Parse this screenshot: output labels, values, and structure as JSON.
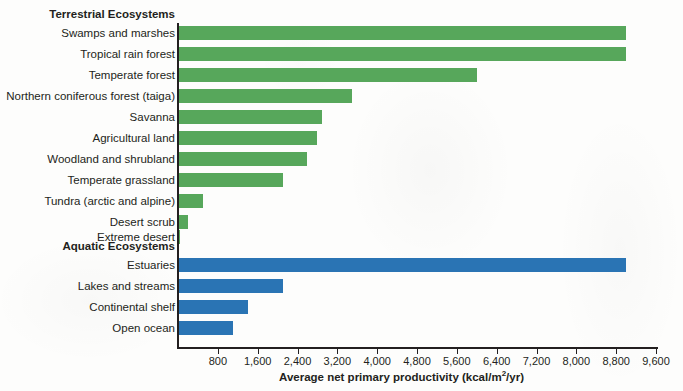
{
  "chart_data": {
    "type": "bar",
    "orientation": "horizontal",
    "title": "",
    "xlabel": "Average net primary productivity (kcal/m2/yr)",
    "xlabel_parts": {
      "before": "Average net primary productivity (kcal/m",
      "sup": "2",
      "after": "/yr)"
    },
    "ylabel": "",
    "xlim": [
      0,
      9600
    ],
    "xticks": [
      800,
      1600,
      2400,
      3200,
      4000,
      4800,
      5600,
      6400,
      7200,
      8000,
      8800,
      9600
    ],
    "xtick_labels": [
      "800",
      "1,600",
      "2,400",
      "3,200",
      "4,000",
      "4,800",
      "5,600",
      "6,400",
      "7,200",
      "8,000",
      "8,800",
      "9,600"
    ],
    "grid": false,
    "legend": "none",
    "colors": {
      "terrestrial": "#57a75b",
      "aquatic": "#2a74b4",
      "axis": "#231f20"
    },
    "groups": [
      {
        "name": "Terrestrial Ecosystems",
        "color_key": "terrestrial",
        "categories": [
          "Swamps and marshes",
          "Tropical rain forest",
          "Temperate forest",
          "Northern coniferous forest (taiga)",
          "Savanna",
          "Agricultural land",
          "Woodland and shrubland",
          "Temperate grassland",
          "Tundra (arctic and alpine)",
          "Desert scrub",
          "Extreme desert"
        ],
        "values": [
          9000,
          9000,
          6000,
          3500,
          2900,
          2800,
          2600,
          2100,
          500,
          200,
          50
        ]
      },
      {
        "name": "Aquatic Ecosystems",
        "color_key": "aquatic",
        "categories": [
          "Estuaries",
          "Lakes and streams",
          "Continental shelf",
          "Open ocean"
        ],
        "values": [
          9000,
          2100,
          1400,
          1100
        ]
      }
    ]
  }
}
